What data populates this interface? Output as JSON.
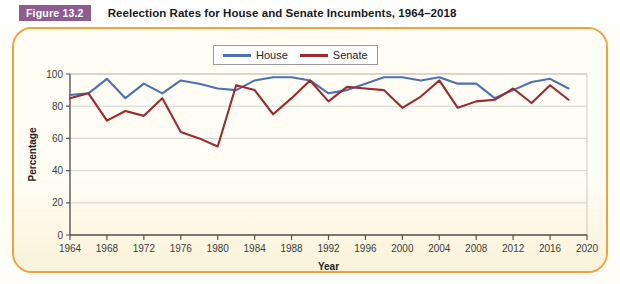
{
  "figure": {
    "badge": "Figure 13.2",
    "title": "Reelection Rates for House and Senate Incumbents, 1964–2018"
  },
  "legend": {
    "position": "top-center",
    "entries": [
      {
        "label": "House",
        "color": "#4a72b8"
      },
      {
        "label": "Senate",
        "color": "#9e2a2f"
      }
    ]
  },
  "colors": {
    "badge": "#8c5d8e",
    "card_border": "#f0a23c",
    "card_background": "#fdf6e0",
    "house": "#4a72b8",
    "senate": "#9e2a2f",
    "gridline": "#c8c8c8",
    "axis": "#555555"
  },
  "chart_data": {
    "type": "line",
    "title": "Reelection Rates for House and Senate Incumbents, 1964–2018",
    "xlabel": "Year",
    "ylabel": "Percentage",
    "xlim": [
      1964,
      2020
    ],
    "ylim": [
      0,
      100
    ],
    "xticks": [
      1964,
      1968,
      1972,
      1976,
      1980,
      1984,
      1988,
      1992,
      1996,
      2000,
      2004,
      2008,
      2012,
      2016,
      2020
    ],
    "yticks": [
      0,
      20,
      40,
      60,
      80,
      100
    ],
    "grid": "horizontal",
    "x": [
      1964,
      1966,
      1968,
      1970,
      1972,
      1974,
      1976,
      1978,
      1980,
      1982,
      1984,
      1986,
      1988,
      1990,
      1992,
      1994,
      1996,
      1998,
      2000,
      2002,
      2004,
      2006,
      2008,
      2010,
      2012,
      2014,
      2016,
      2018
    ],
    "series": [
      {
        "name": "House",
        "color": "#4a72b8",
        "values": [
          87,
          88,
          97,
          85,
          94,
          88,
          96,
          94,
          91,
          90,
          96,
          98,
          98,
          96,
          88,
          90,
          94,
          98,
          98,
          96,
          98,
          94,
          94,
          85,
          90,
          95,
          97,
          91
        ]
      },
      {
        "name": "Senate",
        "color": "#9e2a2f",
        "values": [
          85,
          88,
          71,
          77,
          74,
          85,
          64,
          60,
          55,
          93,
          90,
          75,
          85,
          96,
          83,
          92,
          91,
          90,
          79,
          86,
          96,
          79,
          83,
          84,
          91,
          82,
          93,
          84
        ]
      }
    ]
  },
  "axes": {
    "y_axis_label": "Percentage",
    "x_axis_label": "Year",
    "y_tick_labels": [
      "0",
      "20",
      "40",
      "60",
      "80",
      "100"
    ],
    "x_tick_labels": [
      "1964",
      "1968",
      "1972",
      "1976",
      "1980",
      "1984",
      "1988",
      "1992",
      "1996",
      "2000",
      "2004",
      "2008",
      "2012",
      "2016",
      "2020"
    ]
  }
}
